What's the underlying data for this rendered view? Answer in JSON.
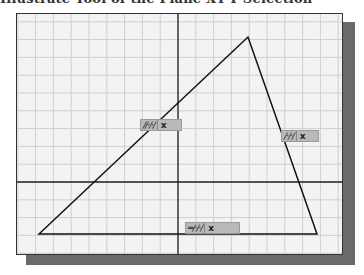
{
  "caption": "Illustrate Tool of the Plane XY-Y Selection",
  "sketch": {
    "frame": {
      "x": 16,
      "y": 13,
      "width": 327,
      "height": 242
    },
    "grid": {
      "spacing": 17.8,
      "color": "#cfcfcf"
    },
    "axes": {
      "vertical_x": 161,
      "horizontal_y": 168,
      "color": "#222222"
    },
    "triangle": {
      "vertices": [
        [
          22,
          220
        ],
        [
          231,
          23
        ],
        [
          300,
          220
        ]
      ],
      "stroke": "#111111"
    },
    "constraints": [
      {
        "id": "left-edge",
        "glyph": "∕∕·∕·∕",
        "delete": "x",
        "x": 140,
        "y": 119,
        "width": 42
      },
      {
        "id": "right-edge",
        "glyph": "∕·∕·∕",
        "delete": "x",
        "x": 281,
        "y": 130,
        "width": 38
      },
      {
        "id": "bottom-edge",
        "glyph": "═∕·∕·∕",
        "delete": "x",
        "x": 185,
        "y": 222,
        "width": 55
      }
    ]
  },
  "colors": {
    "background": "#f3f3f3",
    "shadow": "#6a6a6a",
    "label_bg": "#b9b9b9"
  }
}
